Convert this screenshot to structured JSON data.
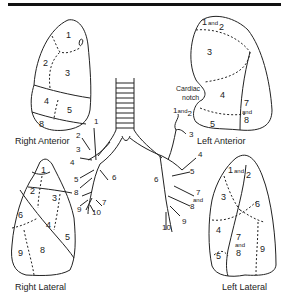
{
  "views": {
    "right_anterior": {
      "caption": "Right Anterior",
      "segments": [
        "1",
        "2",
        "3",
        "4",
        "5",
        "8"
      ]
    },
    "left_anterior": {
      "caption": "Left Anterior",
      "segments": [
        "1 and 2",
        "3",
        "4",
        "5",
        "7 and 8"
      ],
      "annotation": "Cardiac notch"
    },
    "right_lateral": {
      "caption": "Right Lateral",
      "segments": [
        "1",
        "2",
        "3",
        "4",
        "5",
        "6",
        "8",
        "9"
      ]
    },
    "left_lateral": {
      "caption": "Left Lateral",
      "segments": [
        "1 and 2",
        "3",
        "4",
        "5",
        "6",
        "7 and 8",
        "9"
      ]
    }
  },
  "bronchial_tree": {
    "right_labels": [
      "1",
      "2",
      "3",
      "4",
      "5",
      "6",
      "7",
      "8",
      "9",
      "10"
    ],
    "left_labels": [
      "1 and 2",
      "3",
      "4",
      "5",
      "6",
      "7 and 8",
      "9",
      "10"
    ]
  },
  "labels": {
    "and": "and",
    "cardiac": "Cardiac",
    "notch": "notch"
  }
}
